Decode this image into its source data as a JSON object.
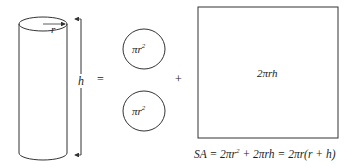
{
  "diagram": {
    "cylinder": {
      "radius_label": "r",
      "height_label": "h"
    },
    "equals_sign": "=",
    "plus_sign": "+",
    "circles": [
      {
        "label": "πr",
        "exponent": "2"
      },
      {
        "label": "πr",
        "exponent": "2"
      }
    ],
    "rectangle": {
      "label": "2πrh"
    },
    "formula": {
      "text": "SA = 2πr² + 2πrh = 2πr(r + h)",
      "parts": {
        "lhs": "SA = 2πr",
        "sup": "2",
        "rhs": " + 2πrh = 2πr(r + h)"
      }
    },
    "colors": {
      "stroke": "#333333",
      "background": "#ffffff"
    }
  }
}
